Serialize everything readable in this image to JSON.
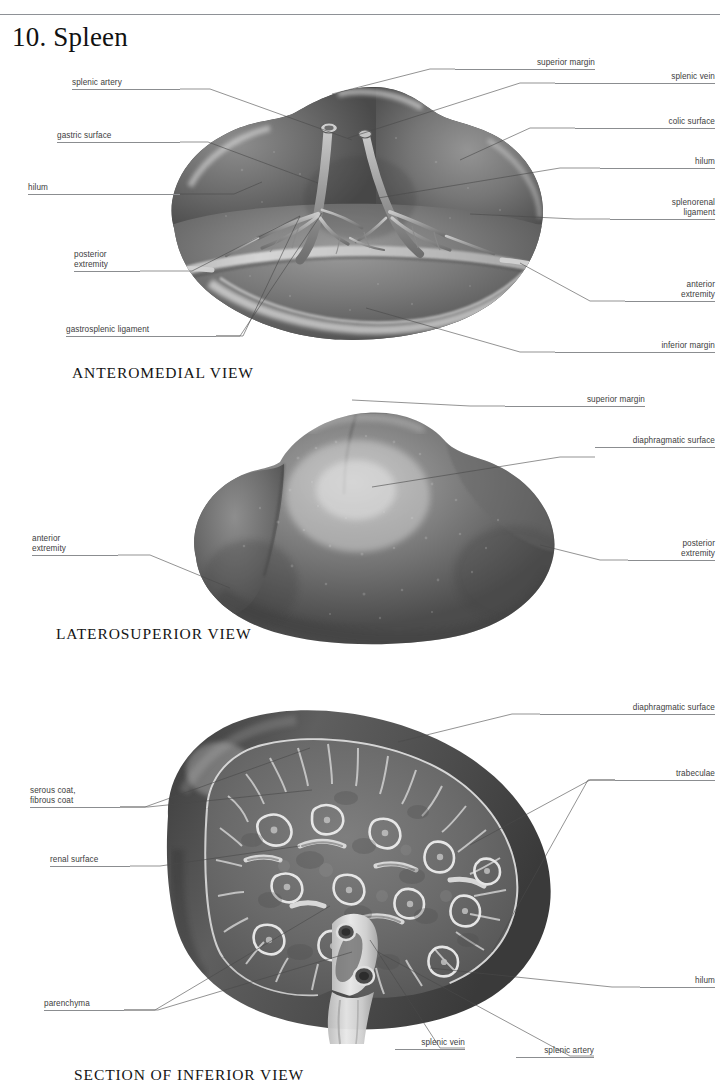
{
  "page": {
    "title": "10. Spleen",
    "running_head": "",
    "accent": "#3d3d3d",
    "rule_color": "#8e9196"
  },
  "figures": [
    {
      "id": "anteromedial",
      "caption": "ANTEROMEDIAL VIEW",
      "labels": [
        {
          "key": "splenic_artery",
          "text": "splenic artery",
          "lines": [
            "splenic artery"
          ],
          "side": "left"
        },
        {
          "key": "gastric_surface",
          "text": "gastric surface",
          "lines": [
            "gastric surface"
          ],
          "side": "left"
        },
        {
          "key": "hilum_left",
          "text": "hilum",
          "lines": [
            "hilum"
          ],
          "side": "left"
        },
        {
          "key": "posterior_extremity",
          "text": "posterior extremity",
          "lines": [
            "posterior",
            "extremity"
          ],
          "side": "left"
        },
        {
          "key": "gastrosplenic_ligament",
          "text": "gastrosplenic ligament",
          "lines": [
            "gastrosplenic ligament"
          ],
          "side": "left"
        },
        {
          "key": "superior_margin",
          "text": "superior margin",
          "lines": [
            "superior margin"
          ],
          "side": "right"
        },
        {
          "key": "splenic_vein",
          "text": "splenic vein",
          "lines": [
            "splenic vein"
          ],
          "side": "right"
        },
        {
          "key": "colic_surface",
          "text": "colic surface",
          "lines": [
            "colic surface"
          ],
          "side": "right"
        },
        {
          "key": "hilum_right",
          "text": "hilum",
          "lines": [
            "hilum"
          ],
          "side": "right"
        },
        {
          "key": "splenorenal_ligament",
          "text": "splenorenal ligament",
          "lines": [
            "splenorenal",
            "ligament"
          ],
          "side": "right"
        },
        {
          "key": "anterior_extremity",
          "text": "anterior extremity",
          "lines": [
            "anterior",
            "extremity"
          ],
          "side": "right"
        },
        {
          "key": "inferior_margin",
          "text": "inferior margin",
          "lines": [
            "inferior margin"
          ],
          "side": "right"
        }
      ]
    },
    {
      "id": "laterosuperior",
      "caption": "LATEROSUPERIOR VIEW",
      "labels": [
        {
          "key": "superior_margin",
          "text": "superior margin",
          "lines": [
            "superior margin"
          ],
          "side": "right"
        },
        {
          "key": "diaphragmatic_surface",
          "text": "diaphragmatic surface",
          "lines": [
            "diaphragmatic surface"
          ],
          "side": "right"
        },
        {
          "key": "anterior_extremity",
          "text": "anterior extremity",
          "lines": [
            "anterior",
            "extremity"
          ],
          "side": "left"
        },
        {
          "key": "posterior_extremity",
          "text": "posterior extremity",
          "lines": [
            "posterior",
            "extremity"
          ],
          "side": "right"
        }
      ]
    },
    {
      "id": "section_inferior",
      "caption": "SECTION OF INFERIOR VIEW",
      "labels": [
        {
          "key": "serous_fibrous_coat",
          "text": "serous coat, fibrous coat",
          "lines": [
            "serous coat,",
            "fibrous coat"
          ],
          "side": "left"
        },
        {
          "key": "renal_surface",
          "text": "renal surface",
          "lines": [
            "renal surface"
          ],
          "side": "left"
        },
        {
          "key": "parenchyma",
          "text": "parenchyma",
          "lines": [
            "parenchyma"
          ],
          "side": "left"
        },
        {
          "key": "diaphragmatic_surface",
          "text": "diaphragmatic surface",
          "lines": [
            "diaphragmatic surface"
          ],
          "side": "right"
        },
        {
          "key": "trabeculae",
          "text": "trabeculae",
          "lines": [
            "trabeculae"
          ],
          "side": "right"
        },
        {
          "key": "hilum",
          "text": "hilum",
          "lines": [
            "hilum"
          ],
          "side": "right"
        },
        {
          "key": "splenic_vein",
          "text": "splenic vein",
          "lines": [
            "splenic vein"
          ],
          "side": "right"
        },
        {
          "key": "splenic_artery",
          "text": "splenic artery",
          "lines": [
            "splenic artery"
          ],
          "side": "right"
        }
      ]
    }
  ]
}
